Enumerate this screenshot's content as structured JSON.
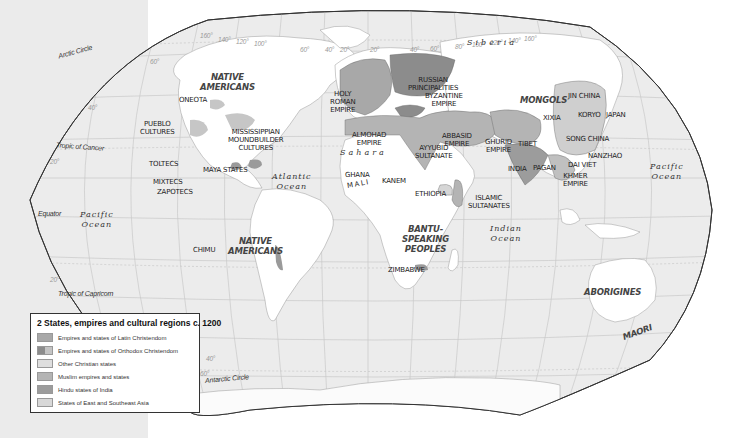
{
  "map": {
    "title": "2 States, empires and cultural regions c. 1200",
    "colors": {
      "ocean": "#ececec",
      "land": "#ffffff",
      "latin": "#a8a8a8",
      "orthodox": "#8c8c8c",
      "other_christian": "#d6d6d6",
      "muslim": "#b4b4b4",
      "hindu": "#9c9c9c",
      "east_asia": "#c8c8c8",
      "sidebar": "#ebebeb"
    },
    "legend": [
      {
        "label": "Empires and states of Latin Christendom",
        "color": "#a8a8a8"
      },
      {
        "label": "Empires and states of Orthodox Christendom",
        "color": "#8c8c8c"
      },
      {
        "label": "Other Christian states",
        "color": "#d6d6d6"
      },
      {
        "label": "Muslim empires and states",
        "color": "#b4b4b4"
      },
      {
        "label": "Hindu states of India",
        "color": "#9c9c9c"
      },
      {
        "label": "States of East and Southeast Asia",
        "color": "#cfcfcf"
      }
    ],
    "lines": {
      "arctic": "Arctic Circle",
      "cancer": "Tropic of Cancer",
      "equator": "Equator",
      "capricorn": "Tropic of Capricorn",
      "antarctic": "Antarctic Circle"
    },
    "degrees": {
      "lat60n": "60°",
      "lat40n": "40°",
      "lat20n": "20°",
      "lat20s": "20°",
      "lat40s": "40°",
      "lat60s": "60°",
      "top": [
        "160°",
        "140°",
        "120°",
        "100°",
        "80°",
        "60°",
        "40°",
        "20°",
        "0°",
        "20°",
        "40°",
        "60°",
        "80°",
        "100°",
        "120°",
        "140°",
        "160°"
      ]
    },
    "oceans": {
      "atlantic": [
        "Atlantic",
        "Ocean"
      ],
      "pacific_w": [
        "Pacific",
        "Ocean"
      ],
      "pacific_e": [
        "Pacific",
        "Ocean"
      ],
      "indian": [
        "Indian",
        "Ocean"
      ]
    },
    "regions": {
      "siberia": "Siberia",
      "sahara": "Sahara",
      "mali": "MALI"
    },
    "big_labels": {
      "native_am_n": [
        "NATIVE",
        "AMERICANS"
      ],
      "native_am_s": [
        "NATIVE",
        "AMERICANS"
      ],
      "bantu": [
        "BANTU-",
        "SPEAKING",
        "PEOPLES"
      ],
      "mongols": "MONGOLS",
      "aborigines": "ABORIGINES",
      "maori": "MAORI"
    },
    "states": {
      "oneota": "ONEOTA",
      "pueblo": [
        "PUEBLO",
        "CULTURES"
      ],
      "mississippian": [
        "MISSISSIPPIAN",
        "MOUNDBUILDER",
        "CULTURES"
      ],
      "toltecs": "TOLTECS",
      "maya": "MAYA STATES",
      "mixtecs": "MIXTECS",
      "zapotecs": "ZAPOTECS",
      "chimu": "CHIMU",
      "hre": [
        "HOLY",
        "ROMAN",
        "EMPIRE"
      ],
      "russian": [
        "RUSSIAN",
        "PRINCIPALITIES"
      ],
      "byzantine": [
        "BYZANTINE",
        "EMPIRE"
      ],
      "almohad": [
        "ALMOHAD",
        "EMPIRE"
      ],
      "ayyubid": [
        "AYYUBID",
        "SULTANATE"
      ],
      "abbasid": [
        "ABBASID",
        "EMPIRE"
      ],
      "ghurid": [
        "GHURID",
        "EMPIRE"
      ],
      "tibet": "TIBET",
      "india": "INDIA",
      "pagan": "PAGAN",
      "ghana": "GHANA",
      "kanem": "KANEM",
      "ethiopia": "ETHIOPIA",
      "islamic_sult": [
        "ISLAMIC",
        "SULTANATES"
      ],
      "zimbabwe": "ZIMBABWE",
      "jin": "JIN CHINA",
      "xixia": "XIXIA",
      "koryo": "KORYO",
      "japan": "JAPAN",
      "song": "SONG CHINA",
      "nanzhao": "NANZHAO",
      "daiviet": "DAI VIET",
      "khmer": [
        "KHMER",
        "EMPIRE"
      ]
    }
  }
}
